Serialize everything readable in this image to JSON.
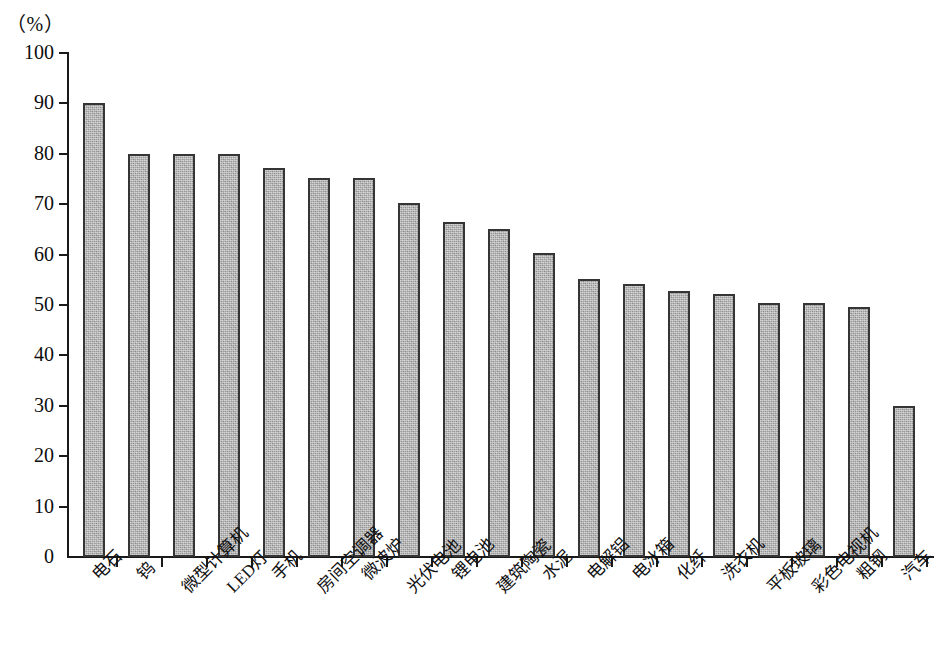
{
  "chart_data": {
    "type": "bar",
    "title": "",
    "subtitle": "",
    "xlabel": "",
    "ylabel": "",
    "unit_label": "（%）",
    "ylim": [
      0,
      100
    ],
    "ytick_labels": [
      "100",
      "90",
      "80",
      "70",
      "60",
      "50",
      "40",
      "30",
      "20",
      "10",
      "0"
    ],
    "yticks": [
      100,
      90,
      80,
      70,
      60,
      50,
      40,
      30,
      20,
      10,
      0
    ],
    "grid": false,
    "legend": null,
    "categories": [
      "电石",
      "钨",
      "微型计算机",
      "LED灯",
      "手机",
      "房间空调器",
      "微波炉",
      "光伏电池",
      "锂电池",
      "建筑陶瓷",
      "水泥",
      "电解铝",
      "电冰箱",
      "化纤",
      "洗衣机",
      "平板玻璃",
      "彩色电视机",
      "粗钢",
      "汽车"
    ],
    "values": [
      90,
      80,
      80,
      80,
      77.2,
      75.2,
      75.2,
      70.2,
      66.5,
      65,
      60.3,
      55.2,
      54.2,
      52.8,
      52.2,
      50.3,
      50.3,
      49.6,
      30
    ]
  },
  "style": {
    "bar_fill": "#a9a9a9",
    "bar_border": "#353535",
    "axis_color": "#1a1a1a",
    "text_color": "#0d0d0d",
    "background": "#ffffff"
  }
}
